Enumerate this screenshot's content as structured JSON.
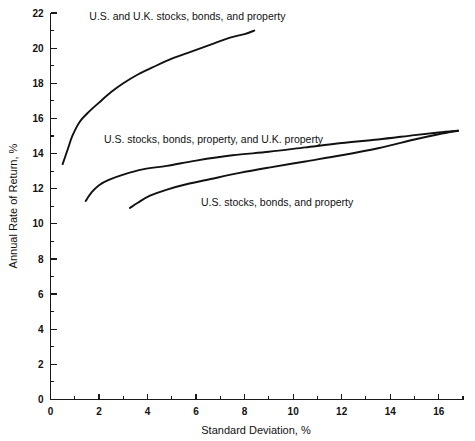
{
  "chart_data": {
    "type": "line",
    "title": "",
    "xlabel": "Standard Deviation, %",
    "ylabel": "Annual Rate of Return, %",
    "xlim": [
      0,
      17
    ],
    "ylim": [
      0,
      22
    ],
    "grid": false,
    "legend_position": "inline-annotations",
    "x_ticks_major": [
      0,
      2,
      4,
      6,
      8,
      10,
      12,
      14,
      16
    ],
    "x_ticks_minor": [
      1,
      3,
      5,
      7,
      9,
      11,
      13,
      15,
      17
    ],
    "x_tick_labels": [
      "0",
      "2",
      "4",
      "6",
      "8",
      "10",
      "12",
      "14",
      "16"
    ],
    "y_ticks_major": [
      0,
      2,
      4,
      6,
      8,
      10,
      12,
      14,
      16,
      18,
      20,
      22
    ],
    "y_ticks_minor": [
      1,
      3,
      5,
      7,
      9,
      11,
      13,
      15,
      17,
      19,
      21
    ],
    "y_tick_labels": [
      "0",
      "2",
      "4",
      "6",
      "8",
      "10",
      "12",
      "14",
      "16",
      "18",
      "20",
      "22"
    ],
    "series": [
      {
        "name": "U.S. and U.K. stocks, bonds, and property",
        "color": "#111111",
        "label_x": 1.6,
        "label_y": 21.6,
        "x": [
          0.5,
          0.7,
          0.9,
          1.2,
          1.6,
          2.0,
          2.5,
          3.0,
          3.6,
          4.2,
          5.0,
          5.8,
          6.6,
          7.4,
          8.0,
          8.4
        ],
        "y": [
          13.4,
          14.2,
          15.0,
          15.8,
          16.4,
          16.9,
          17.5,
          18.0,
          18.5,
          18.9,
          19.4,
          19.8,
          20.2,
          20.6,
          20.8,
          21.0
        ]
      },
      {
        "name": "U.S. stocks, bonds, property, and U.K. property",
        "color": "#111111",
        "label_x": 2.2,
        "label_y": 14.6,
        "x": [
          1.45,
          1.7,
          2.0,
          2.4,
          3.0,
          3.8,
          4.8,
          6.0,
          7.5,
          9.0,
          10.5,
          12.0,
          13.5,
          15.0,
          16.0,
          16.8
        ],
        "y": [
          11.3,
          11.8,
          12.2,
          12.5,
          12.8,
          13.1,
          13.3,
          13.6,
          13.9,
          14.1,
          14.35,
          14.6,
          14.8,
          15.05,
          15.2,
          15.3
        ]
      },
      {
        "name": "U.S. stocks, bonds, and property",
        "color": "#111111",
        "label_x": 6.2,
        "label_y": 11.0,
        "x": [
          3.27,
          3.6,
          4.1,
          4.8,
          5.6,
          6.6,
          7.8,
          9.0,
          10.5,
          12.0,
          13.5,
          15.0,
          16.0,
          16.8
        ],
        "y": [
          10.9,
          11.2,
          11.6,
          11.95,
          12.25,
          12.55,
          12.9,
          13.2,
          13.55,
          13.9,
          14.3,
          14.8,
          15.1,
          15.3
        ]
      }
    ]
  }
}
